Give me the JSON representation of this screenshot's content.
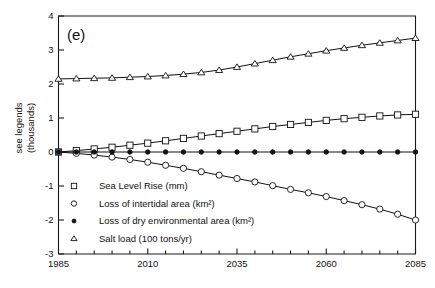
{
  "chart_data": {
    "type": "line",
    "title": "",
    "panel_label": "(e)",
    "xlabel": "",
    "ylabel": "see legends\n(thousands)",
    "ylabel_line1": "see legends",
    "ylabel_line2": "(thousands)",
    "xlim": [
      1985,
      2085
    ],
    "ylim": [
      -3,
      4
    ],
    "xticks": [
      1985,
      2010,
      2035,
      2060,
      2085
    ],
    "xtick_labels": [
      "1985",
      "2010",
      "2035",
      "2060",
      "2085"
    ],
    "xminor_step": 5,
    "yticks": [
      -3,
      -2,
      -1,
      0,
      1,
      2,
      3,
      4
    ],
    "ytick_labels": [
      "-3",
      "-2",
      "-1",
      "0",
      "1",
      "2",
      "3",
      "4"
    ],
    "grid": false,
    "legend_position": "lower-left-inside",
    "x": [
      1985,
      1990,
      1995,
      2000,
      2005,
      2010,
      2015,
      2020,
      2025,
      2030,
      2035,
      2040,
      2045,
      2050,
      2055,
      2060,
      2065,
      2070,
      2075,
      2080,
      2085
    ],
    "series": [
      {
        "name": "Sea Level Rise (mm)",
        "marker": "open-square",
        "values": [
          0.0,
          0.04,
          0.09,
          0.14,
          0.2,
          0.26,
          0.33,
          0.4,
          0.47,
          0.54,
          0.61,
          0.68,
          0.75,
          0.81,
          0.87,
          0.93,
          0.98,
          1.02,
          1.06,
          1.09,
          1.11
        ]
      },
      {
        "name": "Loss of intertidal area (km²)",
        "marker": "open-circle",
        "values": [
          0.0,
          -0.04,
          -0.09,
          -0.15,
          -0.22,
          -0.3,
          -0.39,
          -0.48,
          -0.58,
          -0.68,
          -0.78,
          -0.88,
          -0.99,
          -1.1,
          -1.2,
          -1.31,
          -1.43,
          -1.55,
          -1.68,
          -1.83,
          -2.0
        ]
      },
      {
        "name": "Loss of dry environmental area (km²)",
        "marker": "filled-circle",
        "values": [
          0.0,
          0.0,
          0.0,
          0.0,
          0.0,
          0.0,
          0.0,
          0.0,
          0.0,
          0.0,
          0.0,
          0.0,
          0.0,
          0.0,
          0.0,
          0.0,
          0.0,
          0.0,
          0.0,
          0.0,
          0.0
        ]
      },
      {
        "name": "Salt load (100 tons/yr)",
        "marker": "open-triangle",
        "values": [
          2.15,
          2.16,
          2.17,
          2.18,
          2.2,
          2.22,
          2.25,
          2.29,
          2.34,
          2.41,
          2.5,
          2.6,
          2.7,
          2.8,
          2.89,
          2.98,
          3.06,
          3.14,
          3.21,
          3.28,
          3.35
        ]
      }
    ],
    "legend": [
      {
        "label": "Sea Level Rise (mm)",
        "marker": "open-square"
      },
      {
        "label": "Loss of intertidal area (km²)",
        "marker": "open-circle"
      },
      {
        "label": "Loss of dry environmental area (km²)",
        "marker": "filled-circle"
      },
      {
        "label": "Salt load (100 tons/yr)",
        "marker": "open-triangle"
      }
    ],
    "colors": {
      "line": "#111111",
      "axis": "#1a1a1a",
      "background": "#ffffff"
    }
  }
}
